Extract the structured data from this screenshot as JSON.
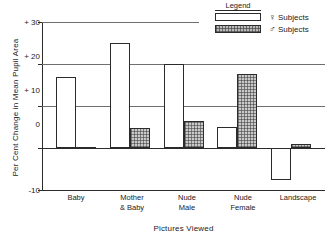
{
  "chart_data": {
    "type": "bar",
    "title": "",
    "xlabel": "Pictures Viewed",
    "ylabel": "Per Cent Change in Mean Pupil Area",
    "categories": [
      "Baby",
      "Mother\n& Baby",
      "Nude\nMale",
      "Nude\nFemale",
      "Landscape"
    ],
    "category_lines": [
      [
        "Baby"
      ],
      [
        "Mother",
        "& Baby"
      ],
      [
        "Nude",
        "Male"
      ],
      [
        "Nude",
        "Female"
      ],
      [
        "Landscape"
      ]
    ],
    "series": [
      {
        "name": "♀ Subjects",
        "key": "female",
        "values": [
          17.0,
          25.0,
          20.0,
          5.0,
          -7.5
        ]
      },
      {
        "name": "♂ Subjects",
        "key": "male",
        "values": [
          0.2,
          4.8,
          6.5,
          17.7,
          1.0
        ]
      }
    ],
    "ylim": [
      -10,
      30
    ],
    "yticks": [
      30,
      20,
      10,
      0,
      -10
    ],
    "ytick_labels": [
      "+ 30",
      "+ 20",
      "+ 10",
      "0",
      "-10"
    ],
    "grid": true,
    "gridlines_at": [
      30,
      20,
      10
    ],
    "legend_position": "top-right"
  },
  "legend": {
    "title": "Legend",
    "entries": [
      {
        "symbol": "♀",
        "label": "Subjects",
        "swatch": "white"
      },
      {
        "symbol": "♂",
        "label": "Subjects",
        "swatch": "hatched"
      }
    ]
  },
  "colors": {
    "axis": "#2b2b2b",
    "grid": "#6f6f6f",
    "female_fill": "#ffffff",
    "male_fill": "#c9c9c9",
    "text": "#222222",
    "background": "#ffffff"
  }
}
